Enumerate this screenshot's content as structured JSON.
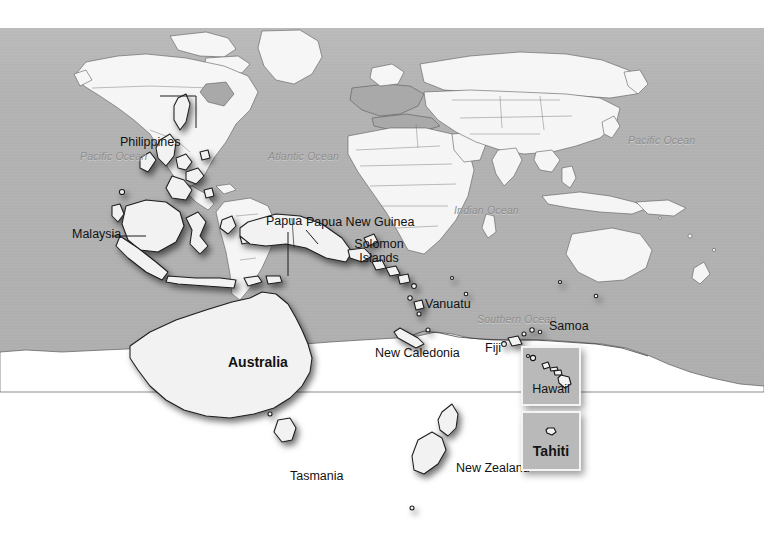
{
  "map": {
    "kind": "world-map-pacific-overlay",
    "background_color": "#b2b2b2",
    "land_color": "#fbfbfb",
    "outline_color": "#1d1d1d",
    "ocean_label_color": "#8d8d8d",
    "canvas": {
      "width": 764,
      "height": 543
    }
  },
  "ocean_labels": [
    {
      "name": "pacific-ocean-west",
      "text": "Pacific Ocean"
    },
    {
      "name": "atlantic-ocean",
      "text": "Atlantic Ocean"
    },
    {
      "name": "indian-ocean",
      "text": "Indian Ocean"
    },
    {
      "name": "pacific-ocean-east",
      "text": "Pacific Ocean"
    },
    {
      "name": "southern-ocean",
      "text": "Southern Ocean"
    }
  ],
  "place_labels": [
    {
      "name": "philippines",
      "text": "Philippines"
    },
    {
      "name": "malaysia",
      "text": "Malaysia"
    },
    {
      "name": "papua",
      "text": "Papua"
    },
    {
      "name": "papua-new-guinea",
      "text": "Papua New Guinea"
    },
    {
      "name": "solomon-islands-1",
      "text": "Solomon"
    },
    {
      "name": "solomon-islands-2",
      "text": "Islands"
    },
    {
      "name": "vanuatu",
      "text": "Vanuatu"
    },
    {
      "name": "new-caledonia",
      "text": "New Caledonia"
    },
    {
      "name": "fiji",
      "text": "Fiji"
    },
    {
      "name": "samoa",
      "text": "Samoa"
    },
    {
      "name": "australia",
      "text": "Australia"
    },
    {
      "name": "tasmania",
      "text": "Tasmania"
    },
    {
      "name": "new-zealand",
      "text": "New Zealand"
    }
  ],
  "insets": [
    {
      "name": "hawaii",
      "caption": "Hawaii",
      "bold": false
    },
    {
      "name": "tahiti",
      "caption": "Tahiti",
      "bold": true
    }
  ]
}
